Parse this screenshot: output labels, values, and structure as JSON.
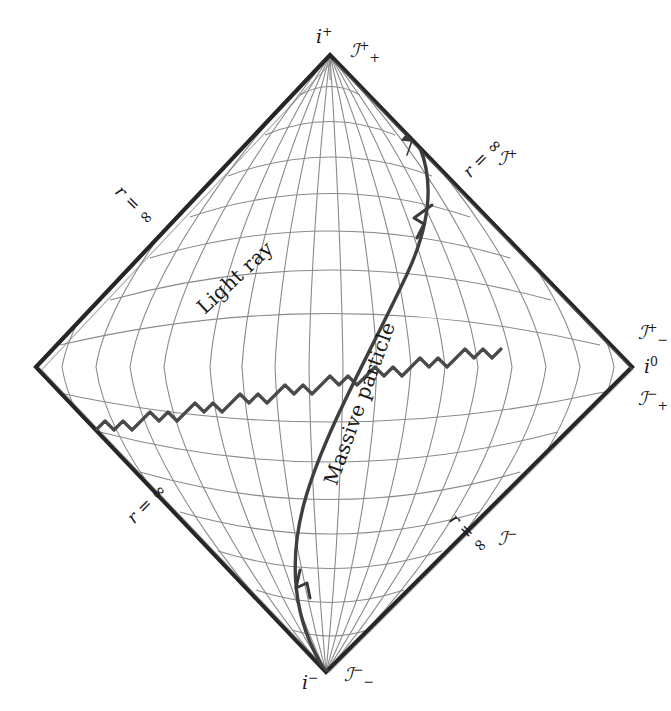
{
  "figure": {
    "background_color": "#ffffff",
    "ink_color": "#1a1a1a",
    "grid_color": "#8a8a8a",
    "worldline_color": "#444444",
    "width": 671,
    "height": 711
  },
  "boundary": {
    "shape": "diamond",
    "vertices": {
      "top": {
        "x": 330,
        "y": 55
      },
      "right": {
        "x": 632,
        "y": 367
      },
      "bottom": {
        "x": 326,
        "y": 672
      },
      "left": {
        "x": 36,
        "y": 367
      }
    }
  },
  "labels": {
    "i_plus": {
      "base": "i",
      "sup": "+",
      "sub": ""
    },
    "i_minus": {
      "base": "i",
      "sup": "−",
      "sub": ""
    },
    "i_zero": {
      "base": "i",
      "sup": "0",
      "sub": ""
    },
    "scri_plus_plus": {
      "base": "ℐ",
      "sup": "+",
      "sub": "+"
    },
    "scri_minus_minus": {
      "base": "ℐ",
      "sup": "−",
      "sub": "−"
    },
    "scri_plus_minus": {
      "base": "ℐ",
      "sup": "+",
      "sub": "−"
    },
    "scri_minus_plus": {
      "base": "ℐ",
      "sup": "−",
      "sub": "+"
    },
    "scri_plus": {
      "base": "ℐ",
      "sup": "+",
      "sub": ""
    },
    "scri_minus": {
      "base": "ℐ",
      "sup": "−",
      "sub": ""
    },
    "r_infinity": "r = ∞",
    "light_ray": "Light ray",
    "massive_particle": "Massive particle"
  },
  "edges": [
    {
      "name": "upper-left",
      "label": "r = ∞",
      "meaning": "null infinity"
    },
    {
      "name": "upper-right",
      "label": "r = ∞",
      "scri": "ℐ⁺"
    },
    {
      "name": "lower-left",
      "label": "r = ∞",
      "meaning": "null infinity"
    },
    {
      "name": "lower-right",
      "label": "r = ∞",
      "scri": "ℐ⁻"
    }
  ],
  "grid": {
    "constant_time_curves": 15,
    "constant_radius_curves": 13,
    "description": "conformally compactified Minkowski coordinate grid"
  },
  "trajectories": [
    {
      "name": "light-ray",
      "style": "zigzag",
      "label": "Light ray",
      "description": "null geodesic zigzagging at 45 degrees, terminating on future null infinity",
      "arrowheads": 1
    },
    {
      "name": "massive-particle",
      "style": "smooth-curve",
      "label": "Massive particle",
      "description": "timelike worldline from past timelike infinity to future timelike infinity",
      "arrowheads": 2
    }
  ]
}
